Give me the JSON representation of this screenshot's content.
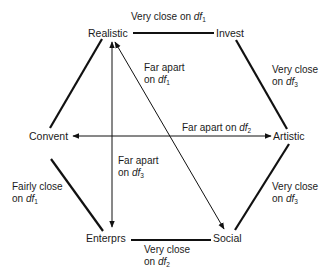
{
  "nodes": {
    "realistic": "Realistic",
    "invest": "Invest",
    "artistic": "Artistic",
    "social": "Social",
    "enterprs": "Enterprs",
    "convent": "Convent"
  },
  "edge_labels": {
    "realistic_invest": {
      "line1": "Very close on ",
      "df": "df",
      "sub": "1"
    },
    "invest_artistic": {
      "line1": "Very close",
      "line2": "on ",
      "df": "df",
      "sub": "3"
    },
    "artistic_social": {
      "line1": "Very close",
      "line2": "on ",
      "df": "df",
      "sub": "3"
    },
    "enterprs_social": {
      "line1": "Very close",
      "line2": "on ",
      "df": "df",
      "sub": "2"
    },
    "convent_enterprs": {
      "line1": "Fairly close",
      "line2": "on ",
      "df": "df",
      "sub": "1"
    },
    "realistic_social": {
      "line1": "Far apart",
      "line2": "on ",
      "df": "df",
      "sub": "1"
    },
    "convent_artistic": {
      "line1": "Far apart on ",
      "df": "df",
      "sub": "2"
    },
    "realistic_enterprs": {
      "line1": "Far apart",
      "line2": "on ",
      "df": "df",
      "sub": "3"
    }
  }
}
